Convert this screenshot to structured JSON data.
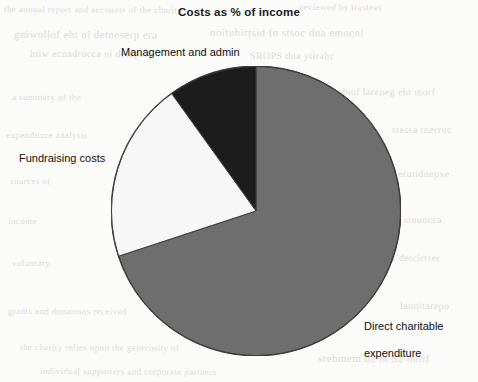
{
  "chart_data": {
    "type": "pie",
    "title": "Costs as % of income",
    "subtitle": "",
    "xlabel": "",
    "ylabel": "",
    "legend_position": "none",
    "grid": false,
    "start_angle_deg": 90,
    "direction": "counterclockwise",
    "units": "percent",
    "categories": [
      "Direct charitable expenditure",
      "Management and admin",
      "Fundraising costs"
    ],
    "values": [
      70,
      10,
      20
    ],
    "slices": [
      {
        "label": "Direct charitable expenditure",
        "label_text": "Direct charitable\nexpenditure",
        "value": 70,
        "color": "#6e6e6e",
        "start_deg": 108.2,
        "end_deg": 360.0,
        "sweep_deg": 251.8
      },
      {
        "label": "Management and admin",
        "label_text": "Management and admin",
        "value": 10,
        "color": "#1c1c1c",
        "start_deg": 0.0,
        "end_deg": 35.7,
        "sweep_deg": 35.7
      },
      {
        "label": "Fundraising costs",
        "label_text": "Fundraising costs",
        "value": 20,
        "color": "#f7f7f7",
        "start_deg": 35.7,
        "end_deg": 108.2,
        "sweep_deg": 72.5
      }
    ],
    "geometry": {
      "center_x": 256,
      "center_y": 211,
      "radius": 145,
      "outline_color": "#3a3a3a",
      "outline_width": 1
    }
  },
  "chart": {
    "title": "Costs as % of income",
    "labels": {
      "management": "Management and admin",
      "fundraising": "Fundraising costs",
      "direct_line1": "Direct charitable",
      "direct_line2": "expenditure"
    },
    "colors": {
      "direct": "#6e6e6e",
      "management": "#1c1c1c",
      "fundraising": "#f7f7f7",
      "outline": "#3a3a3a",
      "background": "#fbfbfa",
      "text": "#111111"
    }
  },
  "background_artifacts": [
    {
      "text": "the annual report and accounts of the charity",
      "x": 4,
      "y": 4,
      "size": 9,
      "rotate": 0.4
    },
    {
      "text": "reviewed by trustees",
      "x": 300,
      "y": 2,
      "size": 9,
      "rotate": 0.3
    },
    {
      "text": "gniwollof eht ni detneserp era",
      "x": 14,
      "y": 28,
      "size": 11,
      "rotate": 0.2
    },
    {
      "text": "noitubirtsid fo stsoc dna emocni",
      "x": 210,
      "y": 26,
      "size": 11,
      "rotate": 0.2
    },
    {
      "text": "htiw ecnadrocca ni deraperp",
      "x": 30,
      "y": 48,
      "size": 10,
      "rotate": 0.1
    },
    {
      "text": "SROPS dna ytirahc",
      "x": 250,
      "y": 50,
      "size": 10,
      "rotate": 0.1
    },
    {
      "text": "a summary of the",
      "x": 12,
      "y": 92,
      "size": 9,
      "rotate": 0.2
    },
    {
      "text": "dnuf lareneg eht morf",
      "x": 340,
      "y": 86,
      "size": 10,
      "rotate": 0.2
    },
    {
      "text": "expenditure analysis",
      "x": 6,
      "y": 130,
      "size": 9,
      "rotate": 0.1
    },
    {
      "text": "stessa tnerruc",
      "x": 392,
      "y": 124,
      "size": 10,
      "rotate": 0.1
    },
    {
      "text": "sources of",
      "x": 10,
      "y": 176,
      "size": 9,
      "rotate": 0.2
    },
    {
      "text": "erutidnepxe",
      "x": 398,
      "y": 168,
      "size": 10,
      "rotate": 0.2
    },
    {
      "text": "income",
      "x": 8,
      "y": 216,
      "size": 9,
      "rotate": 0.1
    },
    {
      "text": "stnuocca",
      "x": 404,
      "y": 214,
      "size": 10,
      "rotate": 0.1
    },
    {
      "text": "voluntary",
      "x": 12,
      "y": 258,
      "size": 9,
      "rotate": 0.2
    },
    {
      "text": "sdnuf detcirtser",
      "x": 372,
      "y": 252,
      "size": 10,
      "rotate": 0.2
    },
    {
      "text": "grants and donations received",
      "x": 8,
      "y": 306,
      "size": 9,
      "rotate": 0.2
    },
    {
      "text": "lanoitarepo",
      "x": 400,
      "y": 300,
      "size": 10,
      "rotate": 0.2
    },
    {
      "text": "the charity relies upon the generosity of",
      "x": 20,
      "y": 342,
      "size": 9,
      "rotate": 0.3
    },
    {
      "text": "srebmem 02 ot 52 morf",
      "x": 318,
      "y": 352,
      "size": 11,
      "rotate": 0.2
    },
    {
      "text": "individual supporters and corporate partners",
      "x": 40,
      "y": 366,
      "size": 9,
      "rotate": 0.3
    }
  ]
}
